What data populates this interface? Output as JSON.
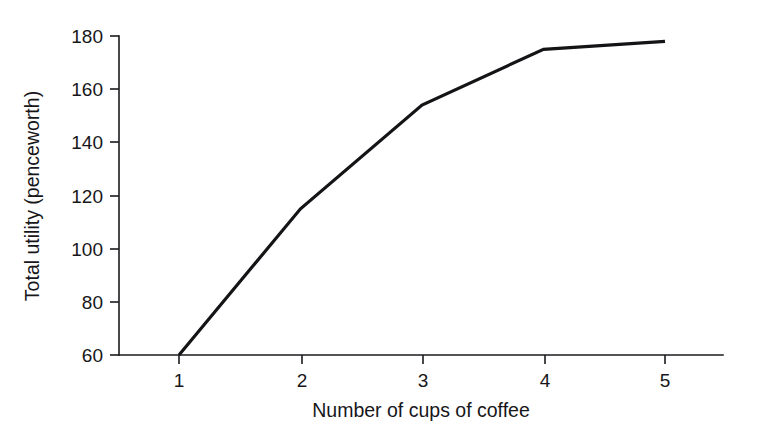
{
  "chart_data": {
    "type": "line",
    "title": "",
    "xlabel": "Number of cups of coffee",
    "ylabel": "Total utility (penceworth)",
    "x": [
      1,
      2,
      3,
      4,
      5
    ],
    "values": [
      60,
      115,
      154,
      175,
      178
    ],
    "series": [
      {
        "name": "Total utility",
        "values": [
          60,
          115,
          154,
          175,
          178
        ],
        "color": "#141417"
      }
    ],
    "xlim": [
      1,
      5.5
    ],
    "ylim": [
      60,
      180
    ],
    "xticks": [
      "1",
      "2",
      "3",
      "4",
      "5"
    ],
    "yticks": [
      "60",
      "80",
      "100",
      "120",
      "140",
      "160",
      "180"
    ],
    "grid": false,
    "legend": false,
    "legend_position": "none"
  },
  "axes": {
    "x_title": "Number of cups of coffee",
    "y_title": "Total utility (penceworth)",
    "x_tick_labels": [
      "1",
      "2",
      "3",
      "4",
      "5"
    ],
    "y_tick_labels": [
      "60",
      "80",
      "100",
      "120",
      "140",
      "160",
      "180"
    ]
  },
  "colors": {
    "background": "#ffffff",
    "ink": "#17171a",
    "line": "#141417"
  }
}
